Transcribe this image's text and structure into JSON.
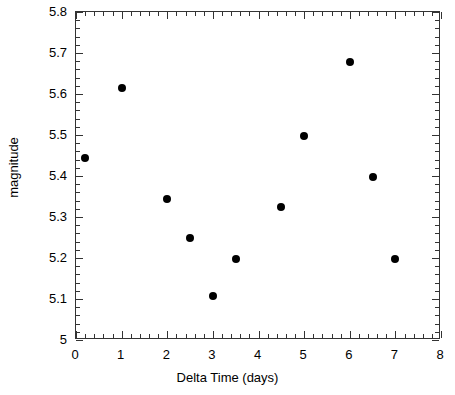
{
  "chart_data": {
    "type": "scatter",
    "title": "",
    "xlabel": "Delta Time (days)",
    "ylabel": "magnitude",
    "xlim": [
      0,
      8
    ],
    "ylim": [
      5.8,
      5.0
    ],
    "y_inverted": true,
    "grid": false,
    "legend": null,
    "xticks": [
      0,
      1,
      2,
      3,
      4,
      5,
      6,
      7,
      8
    ],
    "xtick_labels": [
      "0",
      "1",
      "2",
      "3",
      "4",
      "5",
      "6",
      "7",
      "8"
    ],
    "yticks": [
      5.0,
      5.1,
      5.2,
      5.3,
      5.4,
      5.5,
      5.6,
      5.7,
      5.8
    ],
    "ytick_labels": [
      "5",
      "5.1",
      "5.2",
      "5.3",
      "5.4",
      "5.5",
      "5.6",
      "5.7",
      "5.8"
    ],
    "x_minor_per_major": 5,
    "y_minor_per_major": 5,
    "marker": "filled-circle",
    "marker_color": "#000000",
    "marker_size": 8,
    "points": [
      {
        "x": 0.2,
        "y": 5.445
      },
      {
        "x": 1.0,
        "y": 5.615
      },
      {
        "x": 2.0,
        "y": 5.345
      },
      {
        "x": 2.5,
        "y": 5.248
      },
      {
        "x": 3.0,
        "y": 5.108
      },
      {
        "x": 3.5,
        "y": 5.197
      },
      {
        "x": 4.5,
        "y": 5.325
      },
      {
        "x": 5.0,
        "y": 5.498
      },
      {
        "x": 6.0,
        "y": 5.677
      },
      {
        "x": 6.5,
        "y": 5.397
      },
      {
        "x": 7.0,
        "y": 5.197
      }
    ],
    "x_values": [
      0.2,
      1.0,
      2.0,
      2.5,
      3.0,
      3.5,
      4.5,
      5.0,
      6.0,
      6.5,
      7.0
    ],
    "y_values": [
      5.445,
      5.615,
      5.345,
      5.248,
      5.108,
      5.197,
      5.325,
      5.498,
      5.677,
      5.397,
      5.197
    ]
  },
  "figure": {
    "background_color": "#ffffff",
    "axis_color": "#333333",
    "text_color": "#000000"
  }
}
